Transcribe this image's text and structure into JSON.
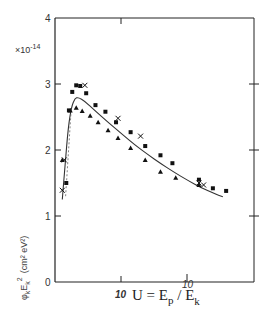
{
  "chart_data": {
    "type": "scatter",
    "title": "",
    "xlabel": "U = E_p / E_k",
    "ylabel": "φ_k E_k^2 (cm^2 eV^2)",
    "y_multiplier": "×10^-14",
    "xlim": [
      0,
      30
    ],
    "ylim": [
      0,
      4
    ],
    "x_ticks": [
      10,
      20
    ],
    "x_tick_labels": [
      "10",
      "10"
    ],
    "y_ticks": [
      0,
      1,
      2,
      3,
      4
    ],
    "y_tick_labels": [
      "0",
      "1",
      "2",
      "3",
      "4"
    ],
    "grid": false,
    "legend": null,
    "series": [
      {
        "name": "squares",
        "marker": "square",
        "x": [
          1.7,
          2.1,
          2.6,
          3.2,
          3.8,
          4.7,
          6.1,
          7.6,
          9.2,
          11.4,
          13.6,
          15.9,
          17.7,
          21.7,
          23.8,
          25.8
        ],
        "y": [
          1.5,
          2.6,
          2.88,
          2.98,
          2.97,
          2.86,
          2.68,
          2.58,
          2.42,
          2.27,
          2.06,
          1.92,
          1.8,
          1.55,
          1.42,
          1.38
        ]
      },
      {
        "name": "triangles",
        "marker": "triangle",
        "x": [
          1.1,
          2.3,
          3.2,
          4.1,
          5.3,
          6.5,
          8.0,
          9.5,
          11.4,
          13.6,
          15.9,
          18.2,
          21.7
        ],
        "y": [
          1.85,
          2.6,
          2.64,
          2.59,
          2.52,
          2.42,
          2.3,
          2.18,
          2.03,
          1.85,
          1.67,
          1.58,
          1.47
        ]
      },
      {
        "name": "crosses",
        "marker": "cross",
        "x": [
          1.1,
          1.4,
          4.5,
          9.5,
          12.9,
          21.7,
          22.4
        ],
        "y": [
          1.39,
          1.85,
          2.98,
          2.48,
          2.21,
          1.5,
          1.47
        ]
      },
      {
        "name": "fit",
        "marker": "line",
        "x": [
          1.1,
          1.5,
          2.0,
          2.5,
          3.0,
          3.5,
          4.5,
          6.0,
          8.0,
          10.0,
          12.0,
          14.0,
          16.0,
          18.0,
          20.0,
          22.0,
          24.0,
          25.3
        ],
        "y": [
          1.25,
          1.75,
          2.35,
          2.66,
          2.78,
          2.8,
          2.74,
          2.6,
          2.42,
          2.25,
          2.08,
          1.93,
          1.79,
          1.66,
          1.54,
          1.43,
          1.34,
          1.29
        ]
      }
    ]
  },
  "axes": {
    "y_ticks": [
      "0",
      "1",
      "2",
      "3",
      "4"
    ],
    "x_tick_10": "10",
    "x_tick_20": "10",
    "multiplier_base": "×10",
    "multiplier_exp": "-14",
    "xlabel_U": "U = E",
    "xlabel_p": "p",
    "xlabel_slash": " / E",
    "xlabel_k": "k",
    "ylabel": "φ",
    "ylabel_k": "k",
    "ylabel_E": "E",
    "ylabel_k2": "k",
    "ylabel_2": "2",
    "ylabel_units": "(cm² eV²)"
  }
}
